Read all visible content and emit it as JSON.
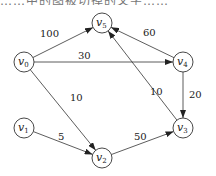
{
  "top_text": "……中的图被切掉的文字……",
  "graph": {
    "type": "directed-weighted",
    "nodes": [
      {
        "id": "v0",
        "name": "v",
        "sub": "0",
        "x": 24,
        "y": 62
      },
      {
        "id": "v1",
        "name": "v",
        "sub": "1",
        "x": 24,
        "y": 128
      },
      {
        "id": "v2",
        "name": "v",
        "sub": "2",
        "x": 102,
        "y": 158
      },
      {
        "id": "v3",
        "name": "v",
        "sub": "3",
        "x": 183,
        "y": 128
      },
      {
        "id": "v4",
        "name": "v",
        "sub": "4",
        "x": 183,
        "y": 62
      },
      {
        "id": "v5",
        "name": "v",
        "sub": "5",
        "x": 102,
        "y": 23
      }
    ],
    "edges": [
      {
        "from": "v0",
        "to": "v5",
        "weight": "100",
        "lx": 40,
        "ly": 37
      },
      {
        "from": "v0",
        "to": "v4",
        "weight": "30",
        "lx": 78,
        "ly": 59
      },
      {
        "from": "v0",
        "to": "v2",
        "weight": "10",
        "lx": 70,
        "ly": 101
      },
      {
        "from": "v1",
        "to": "v2",
        "weight": "5",
        "lx": 58,
        "ly": 140
      },
      {
        "from": "v2",
        "to": "v3",
        "weight": "50",
        "lx": 134,
        "ly": 140
      },
      {
        "from": "v4",
        "to": "v5",
        "weight": "60",
        "lx": 143,
        "ly": 36
      },
      {
        "from": "v3",
        "to": "v5",
        "weight": "10",
        "lx": 150,
        "ly": 95
      },
      {
        "from": "v4",
        "to": "v3",
        "weight": "20",
        "lx": 189,
        "ly": 98
      }
    ]
  }
}
